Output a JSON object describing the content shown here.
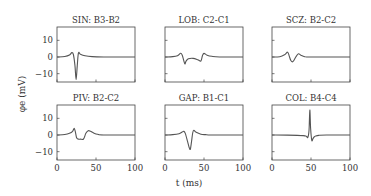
{
  "figure": {
    "xlabel": "t (ms)",
    "ylabel": "φe (mV)",
    "colors": {
      "line": "#555555",
      "axes": "#444444",
      "text": "#333333",
      "background": "#ffffff"
    }
  },
  "chart_data": [
    {
      "type": "line",
      "title": "SIN: B3-B2",
      "xlabel": "",
      "ylabel": "φe (mV)",
      "xlim": [
        0,
        100
      ],
      "ylim": [
        -15,
        18
      ],
      "xticks": [
        0,
        50,
        100
      ],
      "yticks": [
        -10,
        0,
        10
      ],
      "grid": false,
      "x": [
        0,
        10,
        16,
        19,
        21,
        23,
        24.5,
        26,
        27.5,
        30,
        36,
        45,
        60,
        80,
        100
      ],
      "values": [
        0,
        0.3,
        1.2,
        2.6,
        1.5,
        -5,
        -13.5,
        -5,
        2.4,
        1.6,
        0.7,
        0.2,
        0,
        0,
        0
      ]
    },
    {
      "type": "line",
      "title": "LOB: C2-C1",
      "xlabel": "",
      "ylabel": "",
      "xlim": [
        0,
        100
      ],
      "ylim": [
        -15,
        18
      ],
      "xticks": [
        0,
        50,
        100
      ],
      "yticks": [
        -10,
        0,
        10
      ],
      "grid": false,
      "x": [
        0,
        10,
        16,
        20,
        22,
        24,
        25.5,
        27,
        30,
        36,
        42,
        46,
        48,
        50,
        54,
        60,
        70,
        100
      ],
      "values": [
        0,
        0.2,
        0.8,
        2.2,
        1.2,
        -2,
        -4.2,
        -2.5,
        -1.1,
        -0.8,
        -1.6,
        -2.4,
        0.8,
        2.2,
        1.1,
        0.4,
        0,
        0
      ]
    },
    {
      "type": "line",
      "title": "SCZ: B2-C2",
      "xlabel": "",
      "ylabel": "",
      "xlim": [
        0,
        100
      ],
      "ylim": [
        -15,
        18
      ],
      "xticks": [
        0,
        50,
        100
      ],
      "yticks": [
        -10,
        0,
        10
      ],
      "grid": false,
      "x": [
        0,
        10,
        16,
        20,
        22,
        24,
        26,
        28,
        31,
        34,
        37,
        42,
        50,
        100
      ],
      "values": [
        0,
        0.2,
        1.3,
        2.9,
        0.7,
        -2,
        -2.9,
        -2.1,
        0.4,
        1.9,
        1.1,
        0.2,
        0,
        0
      ]
    },
    {
      "type": "line",
      "title": "PIV: B2-C2",
      "xlabel": "",
      "ylabel": "φe (mV)",
      "xlim": [
        0,
        100
      ],
      "ylim": [
        -15,
        18
      ],
      "xticks": [
        0,
        50,
        100
      ],
      "yticks": [
        -10,
        0,
        10
      ],
      "grid": false,
      "x": [
        0,
        10,
        16,
        20,
        22,
        23.5,
        25,
        27,
        30,
        34,
        37,
        40,
        43,
        47,
        52,
        60,
        100
      ],
      "values": [
        0,
        0.3,
        1,
        2.2,
        4,
        2,
        -1.5,
        -2.4,
        -2.5,
        -2.4,
        1,
        2.6,
        2.2,
        1.2,
        0.4,
        0,
        0
      ]
    },
    {
      "type": "line",
      "title": "GAP: B1-C1",
      "xlabel": "t (ms)",
      "ylabel": "",
      "xlim": [
        0,
        100
      ],
      "ylim": [
        -15,
        18
      ],
      "xticks": [
        0,
        50,
        100
      ],
      "yticks": [
        -10,
        0,
        10
      ],
      "grid": false,
      "x": [
        0,
        10,
        18,
        22,
        24,
        26,
        29,
        31,
        32.5,
        34,
        35.5,
        37,
        40,
        46,
        52,
        60,
        100
      ],
      "values": [
        0,
        0.2,
        0.8,
        1.8,
        2.2,
        1,
        -4,
        -7.5,
        -8.5,
        -4,
        1.2,
        2.8,
        1.6,
        0.5,
        0.2,
        0,
        0
      ]
    },
    {
      "type": "line",
      "title": "COL: B4-C4",
      "xlabel": "",
      "ylabel": "",
      "xlim": [
        0,
        100
      ],
      "ylim": [
        -15,
        18
      ],
      "xticks": [
        0,
        50,
        100
      ],
      "yticks": [
        -10,
        0,
        10
      ],
      "grid": false,
      "x": [
        0,
        20,
        40,
        44,
        46,
        47.5,
        48.5,
        49.5,
        51,
        52.5,
        54,
        56,
        60,
        70,
        100
      ],
      "values": [
        0,
        -0.1,
        -0.4,
        -0.8,
        -1.4,
        3,
        15,
        4,
        -3.2,
        -2.2,
        -1.2,
        -0.6,
        -0.2,
        0,
        0
      ]
    }
  ]
}
